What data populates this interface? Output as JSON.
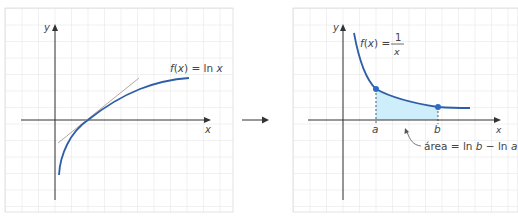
{
  "figure": {
    "left_panel": {
      "function_label": "f(x) = ln x",
      "function_label_parts": {
        "f": "f",
        "open": "(",
        "var": "x",
        "close": ")",
        "eq": " = ln ",
        "arg": "x"
      },
      "x_axis_label": "x",
      "y_axis_label": "y",
      "curve": "ln x",
      "tangent_at": "x = 1",
      "colors": {
        "curve": "#2f5ea8",
        "tangent": "#b9a89a",
        "axis": "#333333",
        "grid": "#dcdcdc"
      }
    },
    "arrow": {
      "direction": "right",
      "color": "#333333"
    },
    "right_panel": {
      "function_label_prefix": "f(x) =",
      "fraction_numerator": "1",
      "fraction_denominator": "x",
      "x_axis_label": "x",
      "y_axis_label": "y",
      "point_a_label": "a",
      "point_b_label": "b",
      "area_label": "área = ln b − ln a",
      "curve": "1/x",
      "colors": {
        "curve": "#2f5ea8",
        "area_fill": "#cdeefa",
        "points": "#2f6cc0",
        "axis": "#333333",
        "grid": "#dcdcdc"
      }
    }
  }
}
